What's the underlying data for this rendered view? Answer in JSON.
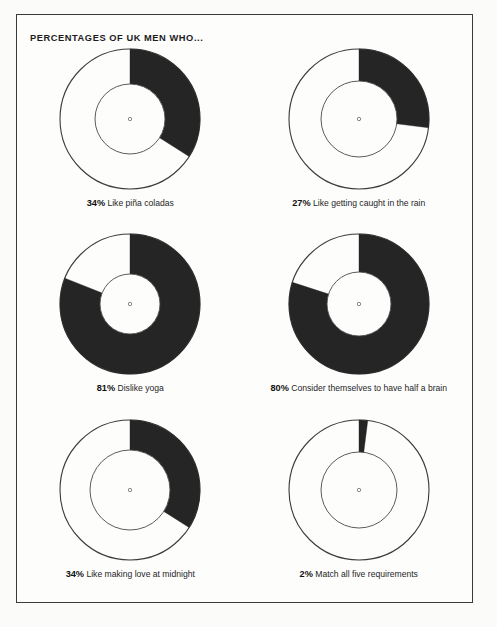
{
  "page": {
    "title": "PERCENTAGES OF UK MEN WHO...",
    "background_color": "#fbfbfa",
    "panel_color": "#fdfdfc",
    "border_color": "#3a3a3a",
    "ink_color": "#252525"
  },
  "chart_data": {
    "type": "pie",
    "title": "PERCENTAGES OF UK MEN WHO...",
    "subtitle": "",
    "xlabel": "",
    "ylabel": "",
    "variant": "donut",
    "units": "percent",
    "start_angle_deg": 0,
    "direction": "clockwise",
    "legend": "none",
    "grid": false,
    "categories": [
      "Like piña coladas",
      "Like getting caught in the rain",
      "Dislike yoga",
      "Consider themselves to have half a brain",
      "Like making love at midnight",
      "Match all five requirements"
    ],
    "values": [
      34,
      27,
      81,
      80,
      34,
      2
    ],
    "slice_colors": [
      "#252525",
      "#fdfdfc"
    ],
    "charts": [
      {
        "id": "pina-coladas",
        "pct": 34,
        "pct_label": "34%",
        "desc": "Like piña coladas",
        "outer_r": 70,
        "inner_r": 35,
        "row": 1,
        "col": 1
      },
      {
        "id": "caught-in-the-rain",
        "pct": 27,
        "pct_label": "27%",
        "desc": "Like getting caught in the rain",
        "outer_r": 70,
        "inner_r": 38,
        "row": 1,
        "col": 2
      },
      {
        "id": "dislike-yoga",
        "pct": 81,
        "pct_label": "81%",
        "desc": "Dislike yoga",
        "outer_r": 70,
        "inner_r": 30,
        "row": 2,
        "col": 1
      },
      {
        "id": "half-a-brain",
        "pct": 80,
        "pct_label": "80%",
        "desc": "Consider themselves to have half a brain",
        "outer_r": 70,
        "inner_r": 32,
        "row": 2,
        "col": 2
      },
      {
        "id": "love-at-midnight",
        "pct": 34,
        "pct_label": "34%",
        "desc": "Like making love at midnight",
        "outer_r": 70,
        "inner_r": 40,
        "row": 3,
        "col": 1
      },
      {
        "id": "all-five-requirements",
        "pct": 2,
        "pct_label": "2%",
        "desc": "Match all five requirements",
        "outer_r": 70,
        "inner_r": 38,
        "row": 3,
        "col": 2
      }
    ]
  }
}
